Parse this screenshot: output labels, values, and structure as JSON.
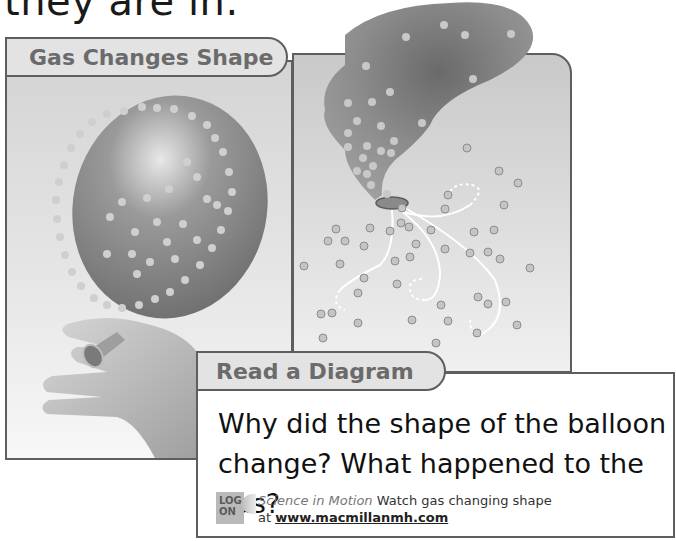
{
  "page": {
    "top_text": "they are in."
  },
  "diagram": {
    "title": "Gas Changes Shape",
    "left_panel": {
      "label": "balloon-inflated-held-by-hand"
    },
    "right_panel": {
      "label": "balloon-deflating-gas-escaping"
    }
  },
  "read_a_diagram": {
    "title": "Read a Diagram",
    "question_line1": "Why did the shape of the balloon",
    "question_line2": "change? What happened to the gas?",
    "logon": {
      "badge_line1": "LOG",
      "badge_line2": "ON",
      "series": "Science in Motion",
      "text": " Watch gas changing shape",
      "at": "at ",
      "url": "www.macmillanmh.com"
    }
  },
  "colors": {
    "border": "#5e5e5e",
    "tab_bg": "#e3e3e3",
    "tab_text": "#6b6b6b",
    "balloon": "#8a8a8a",
    "particle": "#c8c8c8"
  }
}
